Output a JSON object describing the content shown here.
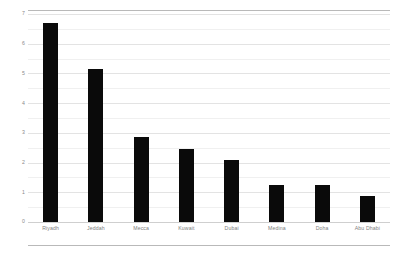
{
  "chart_data": {
    "type": "bar",
    "title": "",
    "subtitle": "",
    "xlabel": "",
    "ylabel": "",
    "categories": [
      "Riyadh",
      "Jeddah",
      "Mecca",
      "Kuwait",
      "Dubai",
      "Medina",
      "Doha",
      "Abu Dhabi"
    ],
    "values": [
      6.7,
      5.15,
      2.85,
      2.45,
      2.1,
      1.25,
      1.25,
      0.87
    ],
    "series": [
      {
        "name": "",
        "values": [
          6.7,
          5.15,
          2.85,
          2.45,
          2.1,
          1.25,
          1.25,
          0.87
        ]
      }
    ],
    "ylim": [
      0,
      7
    ],
    "xlim": [
      0,
      8
    ],
    "ytick_labels": [
      "7",
      "6",
      "5",
      "4",
      "3",
      "2",
      "1",
      "0"
    ],
    "ytick_values": [
      7,
      6,
      5,
      4,
      3,
      2,
      1,
      0
    ],
    "minor_ytick_values": [
      6.5,
      5.5,
      4.5,
      3.5,
      2.5,
      1.5,
      0.5
    ],
    "grid": true,
    "grid_axis": "y",
    "legend": false,
    "legend_position": "none",
    "bar_color": "#0a0a0a",
    "grid_color": "#e3e3e3",
    "minor_grid_color": "#f0f0f0",
    "frame_color": "#b9b9b9",
    "tick_label_color": "#808080",
    "annotations": []
  }
}
